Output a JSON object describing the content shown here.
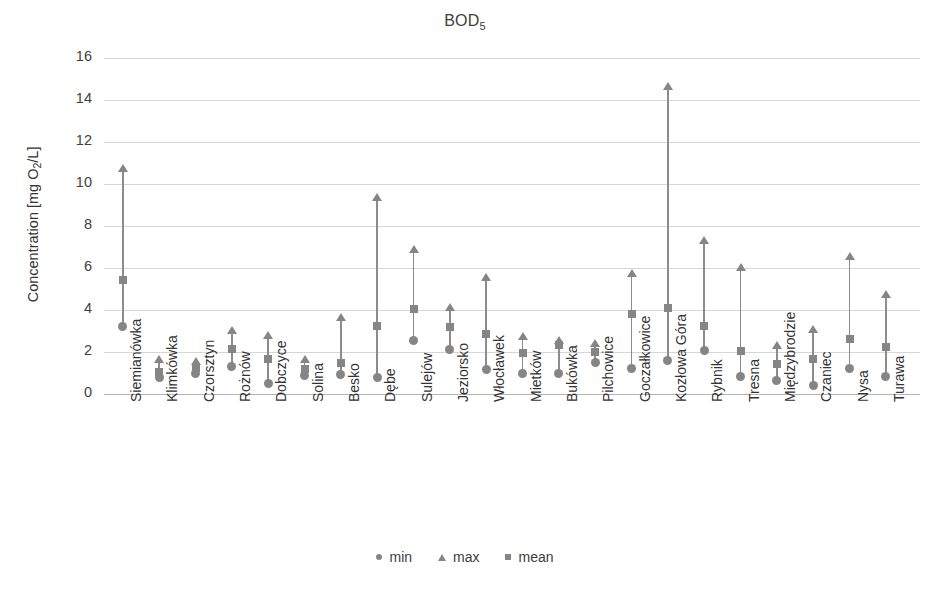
{
  "chart_data": {
    "type": "scatter",
    "title": "BOD5",
    "title_base": "BOD",
    "title_subscript": "5",
    "xlabel": "",
    "ylabel": "Concentration [mg O2/L]",
    "ylabel_prefix": "Concentration [mg O",
    "ylabel_subscript": "2",
    "ylabel_suffix": "/L]",
    "ylim": [
      0,
      16
    ],
    "ytick_step": 2,
    "yticks": [
      16,
      14,
      12,
      10,
      8,
      6,
      4,
      2,
      0
    ],
    "grid": true,
    "grid_axis": "y",
    "legend_position": "bottom",
    "series_names": [
      "min",
      "max",
      "mean"
    ],
    "marker_color": "#858585",
    "line_color": "#8c8c8c",
    "grid_color": "#d6d6d6",
    "categories": [
      "Siemianówka",
      "Klimkówka",
      "Czorsztyn",
      "Rożnów",
      "Dobczyce",
      "Solina",
      "Besko",
      "Dębe",
      "Sulejów",
      "Jeziorsko",
      "Włocławek",
      "Mietków",
      "Bukówka",
      "Pilchowice",
      "Goczałkowice",
      "Kozłowa Góra",
      "Rybnik",
      "Tresna",
      "Międzybrodzie",
      "Czaniec",
      "Nysa",
      "Turawa"
    ],
    "series": [
      {
        "name": "min",
        "marker": "circle",
        "values": [
          3.2,
          0.8,
          1.0,
          1.3,
          0.5,
          0.9,
          0.95,
          0.8,
          2.55,
          2.1,
          1.15,
          1.0,
          1.0,
          1.5,
          1.2,
          1.6,
          2.05,
          0.85,
          0.65,
          0.4,
          1.2,
          0.85
        ]
      },
      {
        "name": "max",
        "marker": "triangle",
        "values": [
          10.75,
          1.65,
          1.55,
          3.05,
          2.8,
          1.65,
          3.65,
          9.4,
          6.9,
          4.15,
          5.55,
          2.75,
          2.55,
          2.45,
          5.75,
          14.65,
          7.35,
          6.05,
          2.35,
          3.1,
          6.55,
          4.75
        ]
      },
      {
        "name": "mean",
        "marker": "square",
        "values": [
          5.45,
          1.05,
          1.25,
          2.15,
          1.65,
          1.2,
          1.5,
          3.25,
          4.05,
          3.2,
          2.85,
          1.95,
          2.35,
          2.0,
          3.8,
          4.1,
          3.25,
          2.05,
          1.45,
          1.65,
          2.6,
          2.25
        ]
      }
    ]
  },
  "legend": {
    "items": [
      {
        "label": "min",
        "marker": "circle"
      },
      {
        "label": "max",
        "marker": "triangle"
      },
      {
        "label": "mean",
        "marker": "square"
      }
    ]
  }
}
